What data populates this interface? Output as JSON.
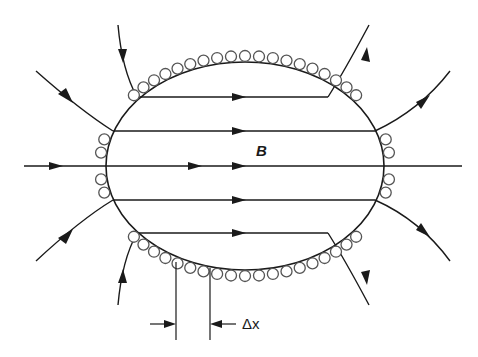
{
  "diagram": {
    "type": "magnetic field of a current sheet / solenoid cross-section",
    "labels": {
      "field": "B",
      "spacing": "Δx"
    },
    "colors": {
      "line": "#1a1a1a",
      "wire": "#555555",
      "background": "#ffffff"
    },
    "ellipse": {
      "cx": 245,
      "cy": 166,
      "rx": 139,
      "ry": 104
    },
    "field_lines_inside": [
      97,
      131,
      166,
      200,
      233
    ],
    "wire_count_top": 19,
    "wire_count_bottom": 19
  }
}
